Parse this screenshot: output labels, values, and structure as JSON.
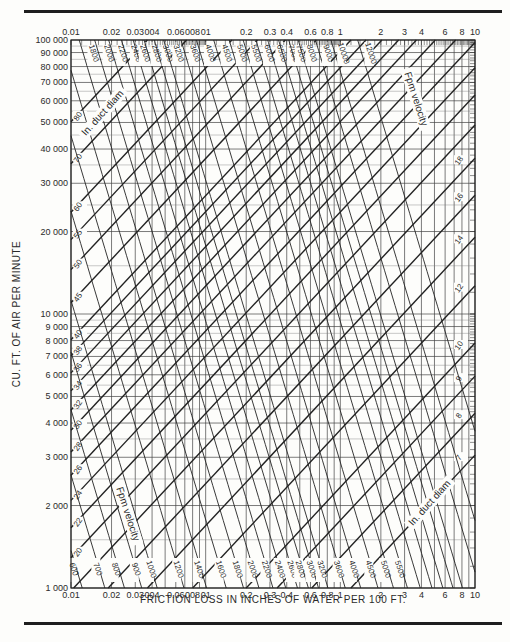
{
  "chart_data": {
    "type": "line",
    "xlabel": "FRICTION LOSS IN INCHES OF WATER PER 100 FT.",
    "ylabel": "CU. FT. OF AIR PER MINUTE",
    "xscale": "log",
    "yscale": "log",
    "xlim": [
      0.01,
      10
    ],
    "ylim": [
      1000,
      100000
    ],
    "grid": true,
    "x_tick_labels": [
      {
        "v": 0.01,
        "t": "0.01"
      },
      {
        "v": 0.02,
        "t": "0.02"
      },
      {
        "v": 0.03,
        "t": "0.03"
      },
      {
        "v": 0.04,
        "t": "004"
      },
      {
        "v": 0.06,
        "t": "0.06"
      },
      {
        "v": 0.08,
        "t": "008"
      },
      {
        "v": 0.1,
        "t": "01"
      },
      {
        "v": 0.2,
        "t": "0.2"
      },
      {
        "v": 0.3,
        "t": "0.3"
      },
      {
        "v": 0.4,
        "t": "0.4"
      },
      {
        "v": 0.6,
        "t": "0.6"
      },
      {
        "v": 0.8,
        "t": "0.8"
      },
      {
        "v": 1,
        "t": "1"
      },
      {
        "v": 2,
        "t": "2"
      },
      {
        "v": 3,
        "t": "3"
      },
      {
        "v": 4,
        "t": "4"
      },
      {
        "v": 6,
        "t": "6"
      },
      {
        "v": 8,
        "t": "8"
      },
      {
        "v": 10,
        "t": "10"
      }
    ],
    "y_tick_labels": [
      {
        "v": 100000,
        "t": "100 000"
      },
      {
        "v": 90000,
        "t": "90 000"
      },
      {
        "v": 80000,
        "t": "80 000"
      },
      {
        "v": 70000,
        "t": "70 000"
      },
      {
        "v": 60000,
        "t": "60 000"
      },
      {
        "v": 50000,
        "t": "50 000"
      },
      {
        "v": 40000,
        "t": "40 000"
      },
      {
        "v": 30000,
        "t": "30 000"
      },
      {
        "v": 20000,
        "t": "20 000"
      },
      {
        "v": 10000,
        "t": "10 000"
      },
      {
        "v": 9000,
        "t": "9 000"
      },
      {
        "v": 8000,
        "t": "8 000"
      },
      {
        "v": 7000,
        "t": "7 000"
      },
      {
        "v": 6000,
        "t": "6 000"
      },
      {
        "v": 5000,
        "t": "5 000"
      },
      {
        "v": 4000,
        "t": "4 000"
      },
      {
        "v": 3000,
        "t": "3 000"
      },
      {
        "v": 2000,
        "t": "2 000"
      },
      {
        "v": 1000,
        "t": "1 000"
      }
    ],
    "series": [
      {
        "name": "In. duct diam",
        "kind": "diameter",
        "values": [
          7,
          8,
          9,
          10,
          12,
          14,
          16,
          18,
          20,
          22,
          24,
          26,
          28,
          30,
          32,
          34,
          36,
          38,
          40,
          45,
          50,
          55,
          60,
          70,
          80
        ]
      },
      {
        "name": "Fpm velocity",
        "kind": "velocity",
        "values": [
          500,
          600,
          700,
          800,
          900,
          1000,
          1200,
          1400,
          1600,
          1800,
          2000,
          2200,
          2400,
          2600,
          2800,
          3000,
          3200,
          3600,
          4000,
          4500,
          5000,
          5500,
          6000,
          6500,
          7000,
          7500,
          8000,
          9000,
          10000,
          12000
        ]
      }
    ],
    "annotations": [
      {
        "text": "In. duct diam",
        "position": "upper-left"
      },
      {
        "text": "Fpm velocity",
        "position": "upper-right"
      },
      {
        "text": "Fpm velocity",
        "position": "lower-left"
      },
      {
        "text": "In. duct diam",
        "position": "lower-right"
      }
    ],
    "colors": {
      "ink": "#222222",
      "paper": "#fdfdfb",
      "grid": "#3a3a3a"
    }
  }
}
